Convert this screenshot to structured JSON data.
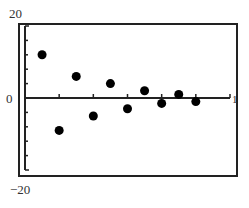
{
  "chart_data": {
    "type": "scatter",
    "title": "",
    "xlabel": "",
    "ylabel": "",
    "xlim": [
      0,
      1
    ],
    "ylim": [
      -20,
      20
    ],
    "grid": false,
    "legend": null,
    "tick_labels": {
      "y_top": "20",
      "y_zero": "0",
      "y_bottom": "−20",
      "x_right": "1"
    },
    "x_ticks": [
      0.1667,
      0.3333,
      0.5,
      0.6667,
      0.8333,
      1.0
    ],
    "y_ticks": [
      -16,
      -12,
      -8,
      -4,
      4,
      8,
      12,
      16
    ],
    "series": [
      {
        "name": "residuals",
        "marker": "filled-circle",
        "color": "#000000",
        "points": [
          {
            "x": 0.0833,
            "y": 12
          },
          {
            "x": 0.1667,
            "y": -9
          },
          {
            "x": 0.25,
            "y": 6
          },
          {
            "x": 0.3333,
            "y": -5
          },
          {
            "x": 0.4167,
            "y": 4
          },
          {
            "x": 0.5,
            "y": -3
          },
          {
            "x": 0.5833,
            "y": 2
          },
          {
            "x": 0.6667,
            "y": -1.5
          },
          {
            "x": 0.75,
            "y": 1
          },
          {
            "x": 0.8333,
            "y": -1
          }
        ]
      }
    ]
  }
}
